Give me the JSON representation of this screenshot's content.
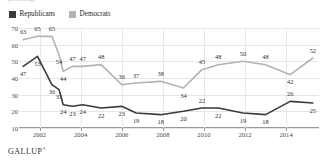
{
  "headline_fragment": "percentage",
  "legend": {
    "position": "top-left",
    "items": [
      {
        "label": "Republicans",
        "color": "#3b3b3b",
        "icon": "legend-swatch"
      },
      {
        "label": "Democrats",
        "color": "#b3b3b3",
        "icon": "legend-swatch"
      }
    ]
  },
  "footer": {
    "brand": "GALLUP",
    "trademark": "®"
  },
  "chart_data": {
    "type": "line",
    "title": "",
    "subtitle": "",
    "xlabel": "",
    "ylabel": "",
    "ylim": [
      10,
      70
    ],
    "y_ticks": [
      70,
      60,
      50,
      40,
      30,
      20,
      10
    ],
    "x_ticks": [
      "2002",
      "2004",
      "2006",
      "2008",
      "2010",
      "2012",
      "2014"
    ],
    "x_tick_values": [
      2002,
      2004,
      2006,
      2008,
      2010,
      2012,
      2014
    ],
    "xlim": [
      2001.0,
      2015.6
    ],
    "grid": "both",
    "legend_position": "top-left",
    "x": [
      2001.2,
      2001.9,
      2002.6,
      2002.95,
      2003.15,
      2003.6,
      2004.1,
      2005.0,
      2006.0,
      2006.7,
      2007.9,
      2009.0,
      2009.9,
      2010.7,
      2011.9,
      2013.0,
      2014.2,
      2015.3
    ],
    "series": [
      {
        "name": "Democrats",
        "color": "#b3b3b3",
        "values": [
          63,
          65,
          65,
          54,
          44,
          47,
          47,
          48,
          36,
          37,
          38,
          34,
          45,
          48,
          50,
          48,
          42,
          52
        ],
        "label_offsets_y": [
          -1,
          -1,
          -1,
          1,
          1,
          -1,
          -1,
          -1,
          -1,
          -1,
          -1,
          1,
          -1,
          -1,
          -1,
          -1,
          1,
          -1
        ]
      },
      {
        "name": "Republicans",
        "color": "#3b3b3b",
        "values": [
          47,
          53,
          36,
          33,
          24,
          23,
          24,
          22,
          23,
          19,
          18,
          20,
          22,
          22,
          19,
          18,
          26,
          25
        ],
        "label_offsets_y": [
          1,
          1,
          1,
          1,
          1,
          1,
          1,
          1,
          1,
          1,
          1,
          1,
          -1,
          1,
          1,
          1,
          -1,
          1
        ]
      }
    ]
  }
}
